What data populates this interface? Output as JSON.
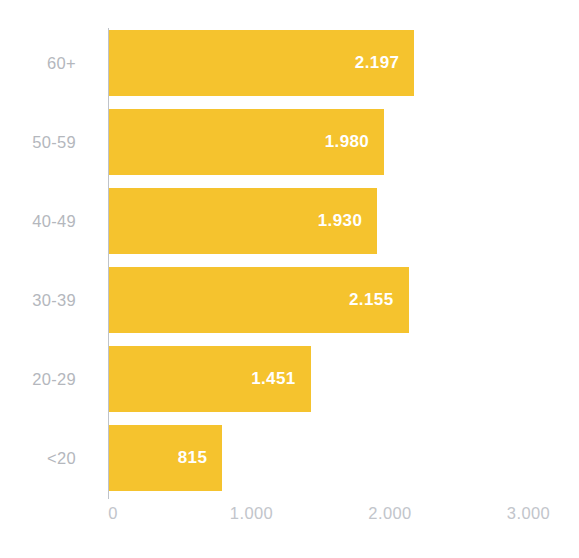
{
  "chart_data": {
    "type": "bar",
    "orientation": "horizontal",
    "title": "",
    "subtitle": "",
    "xlabel": "",
    "ylabel": "",
    "categories": [
      "60+",
      "50-59",
      "40-49",
      "30-39",
      "20-29",
      "<20"
    ],
    "values": [
      2197,
      1980,
      1930,
      2155,
      1451,
      815
    ],
    "value_labels": [
      "2.197",
      "1.980",
      "1.930",
      "2.155",
      "1.451",
      "815"
    ],
    "xlim": [
      0,
      3000
    ],
    "xticks": [
      0,
      1000,
      2000,
      3000
    ],
    "xtick_labels": [
      "0",
      "1.000",
      "2.000",
      "3.000"
    ],
    "grid": false,
    "legend": false,
    "legend_position": "none",
    "bar_color": "#f5c32e",
    "value_label_color": "#ffffff",
    "category_label_color": "#b4b7bd",
    "tick_label_color": "#c2c5cb",
    "axis_line_color": "#bfc3c9",
    "background_color": "#ffffff",
    "annotations": []
  },
  "bars": [
    {
      "category": "60+",
      "value": 2197,
      "label": "2.197"
    },
    {
      "category": "50-59",
      "value": 1980,
      "label": "1.980"
    },
    {
      "category": "40-49",
      "value": 1930,
      "label": "1.930"
    },
    {
      "category": "30-39",
      "value": 2155,
      "label": "2.155"
    },
    {
      "category": "20-29",
      "value": 1451,
      "label": "1.451"
    },
    {
      "category": "<20",
      "value": 815,
      "label": "815"
    }
  ],
  "x_axis": {
    "ticks": [
      {
        "label": "0",
        "value": 0
      },
      {
        "label": "1.000",
        "value": 1000
      },
      {
        "label": "2.000",
        "value": 2000
      },
      {
        "label": "3.000",
        "value": 3000
      }
    ]
  },
  "footer": {
    "clipped_caption": "​"
  }
}
